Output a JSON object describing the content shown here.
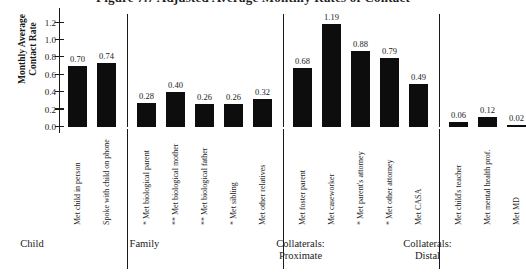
{
  "figure": {
    "title": "Figure 7.7   Adjusted Average Monthly Rates of Contact"
  },
  "chart_data": {
    "type": "bar",
    "title": "Figure 7.7   Adjusted Average Monthly Rates of Contact",
    "xlabel": "",
    "ylabel": "Monthly Average\nContact Rate",
    "ylim": [
      0,
      1.3
    ],
    "grid": false,
    "legend": "none",
    "ytick_labels": [
      "0.0",
      "0.2",
      "0.4",
      "0.6",
      "0.8",
      "1.0",
      "1.2"
    ],
    "ytick_values": [
      0.0,
      0.2,
      0.4,
      0.6,
      0.8,
      1.0,
      1.2
    ],
    "categories": [
      "Met child in person",
      "Spoke with child on phone",
      "Met biological parent",
      "Met biological mother",
      "Met biological father",
      "Met sibling",
      "Met other relatives",
      "Met foster parent",
      "Met caseworker",
      "Met parent's attorney",
      "Met other attorney",
      "Met CASA",
      "Met child's teacher",
      "Met mental health prof.",
      "Met MD"
    ],
    "significance": [
      "",
      "",
      "*",
      "**",
      "**",
      "*",
      "",
      "",
      "",
      "*",
      "*",
      "",
      "",
      "",
      ""
    ],
    "values": [
      0.7,
      0.74,
      0.28,
      0.4,
      0.26,
      0.26,
      0.32,
      0.68,
      1.19,
      0.88,
      0.79,
      0.49,
      0.06,
      0.12,
      0.02
    ],
    "value_labels": [
      "0.70",
      "0.74",
      "0.28",
      "0.40",
      "0.26",
      "0.26",
      "0.32",
      "0.68",
      "1.19",
      "0.88",
      "0.79",
      "0.49",
      "0.06",
      "0.12",
      "0.02"
    ],
    "groups": [
      {
        "label": "Child",
        "start": 0,
        "end": 1
      },
      {
        "label": "Family",
        "start": 2,
        "end": 6
      },
      {
        "label": "Collaterals:\nProximate",
        "start": 7,
        "end": 11
      },
      {
        "label": "Collaterals:\nDistal",
        "start": 12,
        "end": 14
      }
    ]
  }
}
